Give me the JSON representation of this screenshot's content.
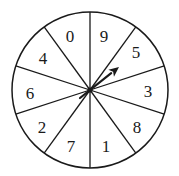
{
  "spinner": {
    "center": [
      90,
      90
    ],
    "radius": 78,
    "stroke_color": "#1a1a1a",
    "sectors": [
      {
        "label": "9",
        "pos": [
          104,
          36
        ]
      },
      {
        "label": "5",
        "pos": [
          136,
          52
        ]
      },
      {
        "label": "3",
        "pos": [
          148,
          91
        ]
      },
      {
        "label": "8",
        "pos": [
          137,
          127
        ]
      },
      {
        "label": "1",
        "pos": [
          106,
          146
        ]
      },
      {
        "label": "7",
        "pos": [
          71,
          146
        ]
      },
      {
        "label": "2",
        "pos": [
          42,
          127
        ]
      },
      {
        "label": "6",
        "pos": [
          30,
          93
        ]
      },
      {
        "label": "4",
        "pos": [
          43,
          58
        ]
      },
      {
        "label": "0",
        "pos": [
          70,
          36
        ]
      }
    ],
    "spoke_angles_deg": [
      90,
      54,
      18,
      -18,
      -54,
      -90,
      -126,
      -162,
      162,
      126
    ],
    "arrow": {
      "tail": [
        80,
        98
      ],
      "tip": [
        119,
        67
      ],
      "pointing_at": "5"
    }
  }
}
